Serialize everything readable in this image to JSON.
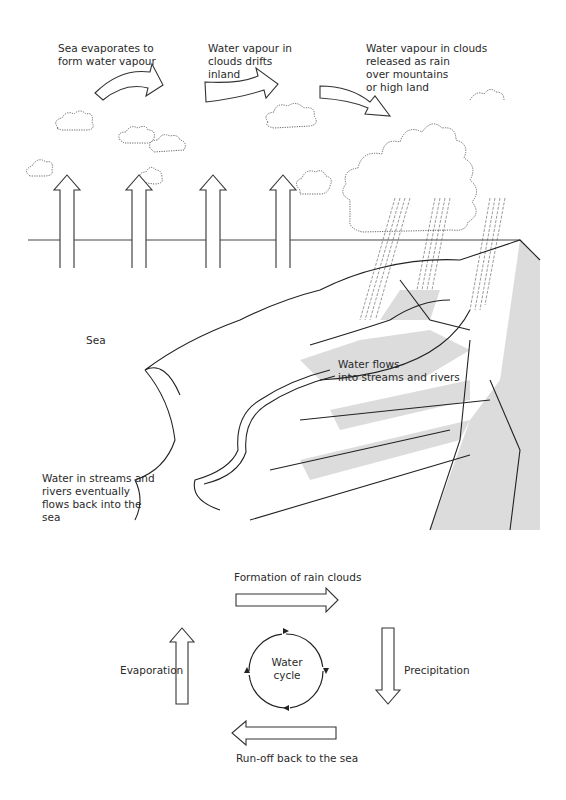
{
  "illustration": {
    "labels": {
      "sea_evaporates": "Sea evaporates to\nform water vapour",
      "vapour_drifts": "Water vapour in\nclouds drifts\ninland",
      "vapour_released": "Water vapour in clouds\nreleased as rain\nover mountains\nor high land",
      "sea": "Sea",
      "water_flows": "Water flows\ninto streams and rivers",
      "flows_back": "Water in streams and\nrivers eventually\nflows back into the\nsea"
    },
    "colors": {
      "line": "#222222",
      "shade": "#dcdcdc",
      "background": "#ffffff"
    }
  },
  "cycle": {
    "center_label": "Water\ncycle",
    "top_label": "Formation of rain clouds",
    "right_label": "Precipitation",
    "bottom_label": "Run-off back to the sea",
    "left_label": "Evaporation"
  }
}
